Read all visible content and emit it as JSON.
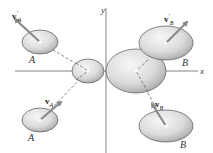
{
  "diagram": {
    "axes": {
      "x_label": "x",
      "y_label": "y"
    },
    "bodies": [
      {
        "id": "A_after",
        "label": "A",
        "vector_symbol": "v",
        "vector_sub": "A",
        "vector_prime": "′",
        "position": "top-left"
      },
      {
        "id": "B_after",
        "label": "B",
        "vector_symbol": "v",
        "vector_sub": "B",
        "vector_prime": "′",
        "position": "top-right"
      },
      {
        "id": "A_before",
        "label": "A",
        "vector_symbol": "v",
        "vector_sub": "A",
        "vector_prime": "",
        "position": "bottom-left"
      },
      {
        "id": "B_before",
        "label": "B",
        "vector_symbol": "v",
        "vector_sub": "B",
        "vector_prime": "",
        "position": "bottom-right"
      }
    ],
    "colors": {
      "ellipse_fill_light": "#f2f2f2",
      "ellipse_fill_dark": "#b8b8b8",
      "ellipse_stroke": "#555555",
      "arrow": "#8a8a8a",
      "axis": "#666666",
      "dashed": "#555555"
    }
  }
}
